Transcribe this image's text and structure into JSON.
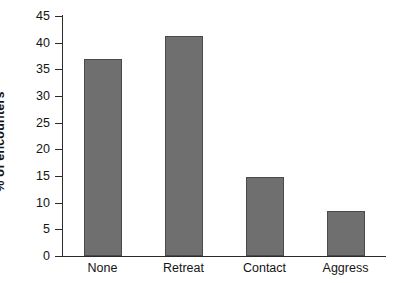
{
  "chart_data": {
    "type": "bar",
    "title": "",
    "subtitle": "",
    "xlabel": "",
    "ylabel": "% of encounters",
    "categories": [
      "None",
      "Retreat",
      "Contact",
      "Aggress"
    ],
    "values": [
      37,
      41.3,
      14.8,
      8.4
    ],
    "ylim": [
      0,
      45
    ],
    "yticks": [
      0,
      5,
      10,
      15,
      20,
      25,
      30,
      35,
      40,
      45
    ],
    "ytick_labels": [
      "0",
      "5",
      "10",
      "15",
      "20",
      "25",
      "30",
      "35",
      "40",
      "45"
    ],
    "grid": false,
    "legend": null,
    "bar_color": "#6f6f6f",
    "bar_edge_color": "#4a4a4a",
    "axis_color": "#2b2b2b",
    "background": "#ffffff"
  },
  "axes": {
    "y_title": "% of encounters"
  }
}
